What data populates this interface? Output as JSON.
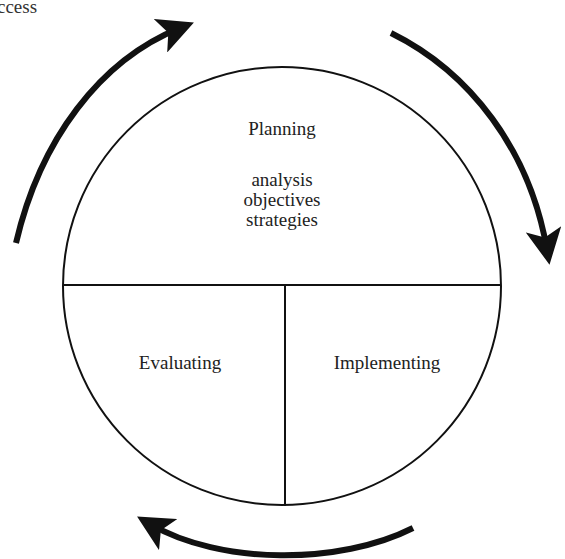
{
  "caption": {
    "visible_fragment": "ccess"
  },
  "diagram": {
    "type": "cycle",
    "circle": {
      "sections": [
        {
          "id": "planning",
          "title": "Planning",
          "items": [
            "analysis",
            "objectives",
            "strategies"
          ],
          "position": "top-half"
        },
        {
          "id": "evaluating",
          "title": "Evaluating",
          "position": "bottom-left-quarter"
        },
        {
          "id": "implementing",
          "title": "Implementing",
          "position": "bottom-right-quarter"
        }
      ]
    },
    "arrows": [
      {
        "id": "arrow-top-left",
        "direction": "clockwise",
        "from": "left",
        "to": "top"
      },
      {
        "id": "arrow-right",
        "direction": "clockwise",
        "from": "top-right",
        "to": "right"
      },
      {
        "id": "arrow-bottom",
        "direction": "clockwise",
        "from": "bottom-right",
        "to": "bottom-left"
      }
    ],
    "colors": {
      "line": "#111111",
      "arrow": "#111111",
      "text": "#222222",
      "background": "#ffffff"
    }
  }
}
